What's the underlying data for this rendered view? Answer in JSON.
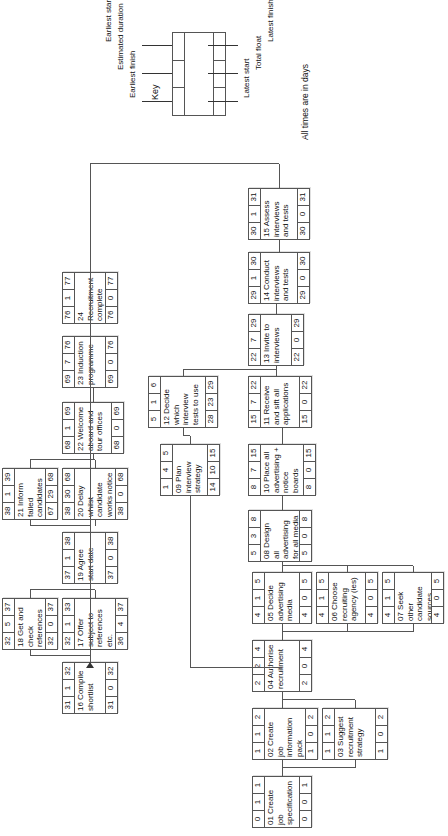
{
  "diagram": {
    "key": {
      "heading": "Key",
      "labels_top": [
        "Earliest finish",
        "Estimated duration",
        "Earliest start"
      ],
      "labels_bottom": [
        "Latest start",
        "Total float",
        "Latest finish"
      ],
      "note": "All times are in days"
    },
    "nodes": [
      {
        "id": "01",
        "es": "0",
        "dur": "1",
        "ef": "1",
        "label": "01 Create job specification",
        "ls": "0",
        "tf": "0",
        "lf": "1"
      },
      {
        "id": "02",
        "es": "1",
        "dur": "1",
        "ef": "2",
        "label": "02 Create job information pack",
        "ls": "1",
        "tf": "0",
        "lf": "2"
      },
      {
        "id": "03",
        "es": "1",
        "dur": "1",
        "ef": "2",
        "label": "03 Suggest recruitment strategy",
        "ls": "1",
        "tf": "0",
        "lf": "2"
      },
      {
        "id": "04",
        "es": "2",
        "dur": "2",
        "ef": "4",
        "label": "04 Authorise recruitment",
        "ls": "2",
        "tf": "0",
        "lf": "4"
      },
      {
        "id": "05",
        "es": "4",
        "dur": "1",
        "ef": "5",
        "label": "05 Decide advertising media",
        "ls": "4",
        "tf": "0",
        "lf": "5"
      },
      {
        "id": "06",
        "es": "4",
        "dur": "1",
        "ef": "5",
        "label": "06 Choose recruiting agency (ies)",
        "ls": "4",
        "tf": "0",
        "lf": "5"
      },
      {
        "id": "07",
        "es": "4",
        "dur": "1",
        "ef": "5",
        "label": "07 Seek other candidate sources",
        "ls": "4",
        "tf": "0",
        "lf": "5"
      },
      {
        "id": "08",
        "es": "5",
        "dur": "3",
        "ef": "8",
        "label": "08 Design all advertising for all media",
        "ls": "5",
        "tf": "0",
        "lf": "8"
      },
      {
        "id": "09",
        "es": "1",
        "dur": "4",
        "ef": "5",
        "label": "09 Plan interview strategy",
        "ls": "14",
        "tf": "10",
        "lf": "15"
      },
      {
        "id": "10",
        "es": "8",
        "dur": "7",
        "ef": "15",
        "label": "10 Place all advertising + notice boards",
        "ls": "8",
        "tf": "0",
        "lf": "15"
      },
      {
        "id": "11",
        "es": "15",
        "dur": "7",
        "ef": "22",
        "label": "11 Receive and sift all applications",
        "ls": "15",
        "tf": "0",
        "lf": "22"
      },
      {
        "id": "12",
        "es": "5",
        "dur": "1",
        "ef": "6",
        "label": "12 Decide which interview tests to use",
        "ls": "28",
        "tf": "23",
        "lf": "29"
      },
      {
        "id": "13",
        "es": "22",
        "dur": "7",
        "ef": "29",
        "label": "13 Invite to interviews",
        "ls": "22",
        "tf": "0",
        "lf": "29"
      },
      {
        "id": "14",
        "es": "29",
        "dur": "1",
        "ef": "30",
        "label": "14 Conduct interviews and tests",
        "ls": "29",
        "tf": "0",
        "lf": "30"
      },
      {
        "id": "15",
        "es": "30",
        "dur": "1",
        "ef": "31",
        "label": "15 Assess interviews and tests",
        "ls": "30",
        "tf": "0",
        "lf": "31"
      },
      {
        "id": "16",
        "es": "31",
        "dur": "1",
        "ef": "32",
        "label": "16 Compile shortlist",
        "ls": "31",
        "tf": "0",
        "lf": "32"
      },
      {
        "id": "17",
        "es": "32",
        "dur": "1",
        "ef": "33",
        "label": "17 Offer subject to references etc.",
        "ls": "36",
        "tf": "4",
        "lf": "37"
      },
      {
        "id": "18",
        "es": "32",
        "dur": "5",
        "ef": "37",
        "label": "18 Get and check references",
        "ls": "32",
        "tf": "0",
        "lf": "37"
      },
      {
        "id": "19",
        "es": "37",
        "dur": "1",
        "ef": "38",
        "label": "19 Agree start date",
        "ls": "37",
        "tf": "0",
        "lf": "38"
      },
      {
        "id": "20",
        "es": "38",
        "dur": "30",
        "ef": "68",
        "label": "20 Delay whilst candidate works notice",
        "ls": "38",
        "tf": "0",
        "lf": "68"
      },
      {
        "id": "21",
        "es": "38",
        "dur": "1",
        "ef": "39",
        "label": "21 Inform failed candidates",
        "ls": "67",
        "tf": "29",
        "lf": "68"
      },
      {
        "id": "22",
        "es": "68",
        "dur": "1",
        "ef": "69",
        "label": "22 Welcome aboard and tour offices",
        "ls": "68",
        "tf": "0",
        "lf": "69"
      },
      {
        "id": "23",
        "es": "69",
        "dur": "7",
        "ef": "76",
        "label": "23 Induction programme",
        "ls": "69",
        "tf": "0",
        "lf": "76"
      },
      {
        "id": "24",
        "es": "76",
        "dur": "1",
        "ef": "77",
        "label": "24 Recruitment complete",
        "ls": "76",
        "tf": "0",
        "lf": "77"
      }
    ]
  }
}
